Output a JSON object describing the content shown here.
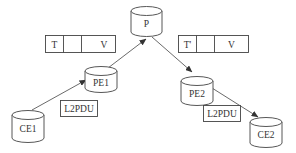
{
  "diagram": {
    "type": "network-topology",
    "colors": {
      "stroke": "#444444",
      "background": "#ffffff",
      "text": "#333333"
    },
    "nodes": [
      {
        "id": "P",
        "label": "P",
        "shape": "cylinder"
      },
      {
        "id": "PE1",
        "label": "PE1",
        "shape": "cylinder"
      },
      {
        "id": "PE2",
        "label": "PE2",
        "shape": "cylinder"
      },
      {
        "id": "CE1",
        "label": "CE1",
        "shape": "cylinder"
      },
      {
        "id": "CE2",
        "label": "CE2",
        "shape": "cylinder"
      }
    ],
    "edges": [
      {
        "from": "CE1",
        "to": "PE1",
        "arrow": "to"
      },
      {
        "from": "PE1",
        "to": "P",
        "arrow": "to"
      },
      {
        "from": "P",
        "to": "PE2",
        "arrow": "to"
      },
      {
        "from": "PE2",
        "to": "CE2",
        "arrow": "to"
      }
    ],
    "label_headers": [
      {
        "id": "left-header",
        "fields": [
          "T",
          "",
          "V"
        ]
      },
      {
        "id": "right-header",
        "fields": [
          "T'",
          "",
          "V"
        ]
      }
    ],
    "pdu_boxes": [
      {
        "id": "left-pdu",
        "label": "L2PDU"
      },
      {
        "id": "right-pdu",
        "label": "L2PDU"
      }
    ]
  }
}
